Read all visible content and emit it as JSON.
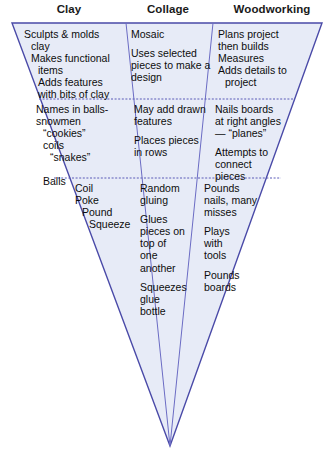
{
  "diagram": {
    "shape": "inverted-triangle-funnel",
    "colors": {
      "fill": "#e7ebf7",
      "stroke": "#4a4aa8",
      "inner_stroke": "#6b6bc4",
      "divider": "#5a5ab8",
      "background": "#ffffff",
      "text": "#111111"
    },
    "geometry": {
      "top_left_x": 12,
      "top_right_x": 322,
      "top_y": 23,
      "apex_x": 170,
      "apex_y": 446,
      "column_divider_top_x": [
        126,
        213
      ],
      "row_divider_y": [
        99,
        178
      ]
    },
    "columns": [
      {
        "id": "clay",
        "label": "Clay"
      },
      {
        "id": "collage",
        "label": "Collage"
      },
      {
        "id": "woodworking",
        "label": "Woodworking"
      }
    ],
    "rows": [
      {
        "id": "row-1",
        "cells": [
          {
            "column": "clay",
            "lines": [
              {
                "text": "Sculpts & molds",
                "indent": 0
              },
              {
                "text": "clay",
                "indent": 1
              },
              {
                "text": "Makes functional",
                "indent": 1
              },
              {
                "text": "items",
                "indent": 2
              },
              {
                "text": "Adds features",
                "indent": 2
              },
              {
                "text": "with bits of clay",
                "indent": 2
              }
            ]
          },
          {
            "column": "collage",
            "paragraphs": [
              "Mosaic",
              "Uses selected\npieces to make a\ndesign"
            ]
          },
          {
            "column": "woodworking",
            "lines": [
              {
                "text": "Plans project",
                "indent": 0
              },
              {
                "text": "then builds",
                "indent": 0
              },
              {
                "text": "Measures",
                "indent": 0
              },
              {
                "text": "Adds details to",
                "indent": 0
              },
              {
                "text": "project",
                "indent": 1
              }
            ]
          }
        ]
      },
      {
        "id": "row-2",
        "cells": [
          {
            "column": "clay",
            "lines": [
              {
                "text": "Names in balls-",
                "indent": 0
              },
              {
                "text": "snowmen",
                "indent": 0
              },
              {
                "text": "“cookies”",
                "indent": 1
              },
              {
                "text": "coils",
                "indent": 1
              },
              {
                "text": "“snakes”",
                "indent": 2
              }
            ],
            "extra": "Balls",
            "extra_indent": 1
          },
          {
            "column": "collage",
            "paragraphs": [
              "May add drawn\nfeatures",
              "  Places pieces\n  in rows"
            ]
          },
          {
            "column": "woodworking",
            "paragraphs": [
              "Nails boards\n  at right angles\n  — “planes”",
              "Attempts to\nconnect\npieces"
            ]
          }
        ]
      },
      {
        "id": "row-3",
        "cells": [
          {
            "column": "clay",
            "lines": [
              {
                "text": "Coil",
                "indent": 0
              },
              {
                "text": "Poke",
                "indent": 0
              },
              {
                "text": "Pound",
                "indent": 1
              },
              {
                "text": "Squeeze",
                "indent": 2
              }
            ]
          },
          {
            "column": "collage",
            "paragraphs": [
              "Random\n gluing",
              "Glues\n pieces on\n top of\n one\n  another",
              "Squeezes\n glue\n bottle"
            ]
          },
          {
            "column": "woodworking",
            "paragraphs": [
              "Pounds\nnails, many\n misses",
              "Plays\n with\ntools",
              "Pounds\nboards"
            ]
          }
        ]
      }
    ]
  }
}
